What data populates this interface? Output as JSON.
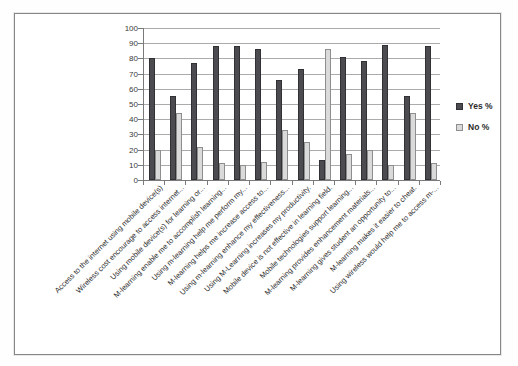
{
  "chart_data": {
    "type": "bar",
    "title": "",
    "categories": [
      "Access to the internet using mobile device(s)",
      "Wireless cost encourage to access internet...",
      "Using mobile device(s) for learning or...",
      "M-learning enable me to accomplish learning...",
      "Using m-learning help me perform my...",
      "M-learning helps me increase access to...",
      "Using m-learning enhance my effectiveness...",
      "Using M-Learning increases my productivity.",
      "Mobile device is not effective in learning field.",
      "Mobile technologies support learning...",
      "M-learning provides enhancement materials...",
      "M-learning gives student an opportunity to...",
      "M-learning makes it easier to cheat.",
      "Using wireless would help me to access m-..."
    ],
    "series": [
      {
        "name": "Yes %",
        "color": "#4c4c50",
        "border": "#313135",
        "values": [
          80,
          55,
          77,
          88,
          88,
          86,
          66,
          73,
          13,
          81,
          78,
          89,
          55,
          88
        ]
      },
      {
        "name": "No %",
        "color": "#dadada",
        "border": "#8e8e8e",
        "values": [
          20,
          44,
          22,
          11,
          10,
          12,
          33,
          25,
          86,
          17,
          20,
          10,
          44,
          11
        ]
      }
    ],
    "ylim": [
      0,
      100
    ],
    "ytick_step": 10,
    "yticks": [
      "100",
      "90",
      "80",
      "70",
      "60",
      "50",
      "40",
      "30",
      "20",
      "10",
      "0"
    ],
    "grid": "horizontal",
    "legend_position": "right",
    "xlabel": "",
    "ylabel": ""
  },
  "colors": {
    "gridline": "#ababab",
    "axis": "#7a7a7a",
    "frame_border": "#868686",
    "text": "#2e2e2e"
  }
}
